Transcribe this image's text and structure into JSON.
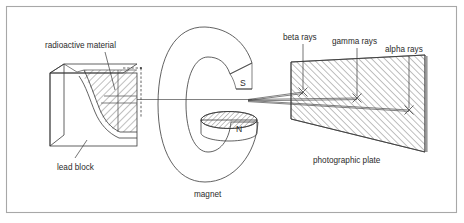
{
  "figure": {
    "width": 464,
    "height": 223,
    "background_color": "#ffffff",
    "frame_color": "#a8a8a8",
    "ink_color": "#3a3a3a",
    "text_color": "#2b2b2b"
  },
  "labels": {
    "radioactive_material": "radioactive material",
    "lead_block": "lead block",
    "magnet": "magnet",
    "photographic_plate": "photographic plate",
    "beta_rays": "beta rays",
    "gamma_rays": "gamma rays",
    "alpha_rays": "alpha rays",
    "pole_south": "S",
    "pole_north": "N"
  },
  "components": {
    "lead_block": {
      "name": "lead block",
      "description": "cut-away 3D lead box with hatched radioactive sample and collimating channel",
      "hatch_fill": true
    },
    "magnet": {
      "name": "magnet",
      "description": "C-shaped horseshoe magnet viewed end-on",
      "poles": [
        {
          "label": "S",
          "position": "upper",
          "hatched": false
        },
        {
          "label": "N",
          "position": "lower",
          "hatched": true
        }
      ]
    },
    "photographic_plate": {
      "name": "photographic plate",
      "description": "hatched quadrilateral plate in perspective with three impact marks",
      "hatch_fill": true,
      "impact_marks": [
        {
          "ray": "beta rays",
          "mark": "x",
          "x": 303,
          "y": 92
        },
        {
          "ray": "gamma rays",
          "mark": "x",
          "x": 357,
          "y": 98
        },
        {
          "ray": "alpha rays",
          "mark": "x",
          "x": 409,
          "y": 110
        }
      ]
    },
    "rays": {
      "origin_description": "rays emerge from lead block channel and separate in the magnet gap",
      "paths": [
        {
          "name": "beta rays",
          "deflection": "upward, strongest"
        },
        {
          "name": "gamma rays",
          "deflection": "undeflected, straight"
        },
        {
          "name": "alpha rays",
          "deflection": "downward, slight"
        }
      ]
    }
  }
}
